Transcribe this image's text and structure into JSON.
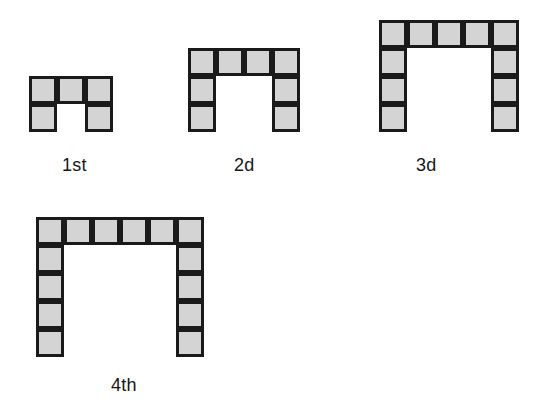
{
  "document": {
    "kind": "geometric-pattern-sequence",
    "description": "Sequence of four U-shaped figures built from identical shaded square tiles",
    "background_color": "#ffffff",
    "tile_fill_color": "#d4d4d4",
    "tile_border_color": "#1a1a1a",
    "label_color": "#161616",
    "cell_size_px": 28,
    "border_width_px": 3
  },
  "figures": [
    {
      "id": "figure-1",
      "label": "1st",
      "top_row_count": 3,
      "leg_height": 1,
      "total_squares": 5,
      "origin": {
        "x": 29,
        "y": 76
      },
      "label_position": {
        "x": 62,
        "y": 156
      },
      "cells": [
        {
          "col": 0,
          "row": 0
        },
        {
          "col": 1,
          "row": 0
        },
        {
          "col": 2,
          "row": 0
        },
        {
          "col": 0,
          "row": 1
        },
        {
          "col": 2,
          "row": 1
        }
      ]
    },
    {
      "id": "figure-2",
      "label": "2d",
      "top_row_count": 4,
      "leg_height": 2,
      "total_squares": 8,
      "origin": {
        "x": 188,
        "y": 48
      },
      "label_position": {
        "x": 234,
        "y": 156
      },
      "cells": [
        {
          "col": 0,
          "row": 0
        },
        {
          "col": 1,
          "row": 0
        },
        {
          "col": 2,
          "row": 0
        },
        {
          "col": 3,
          "row": 0
        },
        {
          "col": 0,
          "row": 1
        },
        {
          "col": 3,
          "row": 1
        },
        {
          "col": 0,
          "row": 2
        },
        {
          "col": 3,
          "row": 2
        }
      ]
    },
    {
      "id": "figure-3",
      "label": "3d",
      "top_row_count": 5,
      "leg_height": 3,
      "total_squares": 11,
      "origin": {
        "x": 379,
        "y": 20
      },
      "label_position": {
        "x": 416,
        "y": 156
      },
      "cells": [
        {
          "col": 0,
          "row": 0
        },
        {
          "col": 1,
          "row": 0
        },
        {
          "col": 2,
          "row": 0
        },
        {
          "col": 3,
          "row": 0
        },
        {
          "col": 4,
          "row": 0
        },
        {
          "col": 0,
          "row": 1
        },
        {
          "col": 4,
          "row": 1
        },
        {
          "col": 0,
          "row": 2
        },
        {
          "col": 4,
          "row": 2
        },
        {
          "col": 0,
          "row": 3
        },
        {
          "col": 4,
          "row": 3
        }
      ]
    },
    {
      "id": "figure-4",
      "label": "4th",
      "top_row_count": 6,
      "leg_height": 4,
      "total_squares": 14,
      "origin": {
        "x": 36,
        "y": 217
      },
      "label_position": {
        "x": 111,
        "y": 376
      },
      "cells": [
        {
          "col": 0,
          "row": 0
        },
        {
          "col": 1,
          "row": 0
        },
        {
          "col": 2,
          "row": 0
        },
        {
          "col": 3,
          "row": 0
        },
        {
          "col": 4,
          "row": 0
        },
        {
          "col": 5,
          "row": 0
        },
        {
          "col": 0,
          "row": 1
        },
        {
          "col": 5,
          "row": 1
        },
        {
          "col": 0,
          "row": 2
        },
        {
          "col": 5,
          "row": 2
        },
        {
          "col": 0,
          "row": 3
        },
        {
          "col": 5,
          "row": 3
        },
        {
          "col": 0,
          "row": 4
        },
        {
          "col": 5,
          "row": 4
        }
      ]
    }
  ],
  "chart_data": {
    "type": "table",
    "title": "",
    "categories": [
      "1st",
      "2d",
      "3d",
      "4th"
    ],
    "series": [
      {
        "name": "Top row squares",
        "values": [
          3,
          4,
          5,
          6
        ]
      },
      {
        "name": "Squares per leg",
        "values": [
          1,
          2,
          3,
          4
        ]
      },
      {
        "name": "Total squares",
        "values": [
          5,
          8,
          11,
          14
        ]
      }
    ],
    "xlabel": "Figure",
    "ylabel": "Squares",
    "grid": false,
    "legend_position": "none"
  }
}
